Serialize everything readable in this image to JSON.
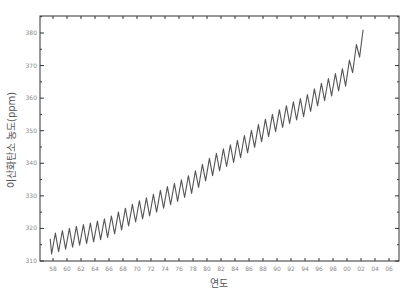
{
  "chart_data": {
    "type": "line",
    "title": "",
    "xlabel": "연도",
    "ylabel": "이산화탄소 농도(ppm)",
    "xlim": [
      1958,
      2006
    ],
    "ylim": [
      310,
      380
    ],
    "x_ticks": [
      "58",
      "60",
      "62",
      "64",
      "66",
      "68",
      "70",
      "72",
      "74",
      "76",
      "78",
      "80",
      "82",
      "84",
      "86",
      "88",
      "90",
      "92",
      "94",
      "96",
      "98",
      "00",
      "02",
      "04",
      "06"
    ],
    "y_ticks": [
      310,
      320,
      330,
      340,
      350,
      360,
      370,
      380
    ],
    "grid": false,
    "legend": null,
    "series": [
      {
        "name": "CO2 concentration (seasonal)",
        "color": "#555555",
        "seasonal_amplitude_ppm": 3,
        "trend_x": [
          1957.6,
          1960,
          1962,
          1964,
          1966,
          1968,
          1970,
          1972,
          1974,
          1976,
          1978,
          1980,
          1982,
          1984,
          1986,
          1988,
          1990,
          1992,
          1994,
          1996,
          1998,
          2000,
          2002.3
        ],
        "trend_y": [
          315.0,
          316.8,
          318.0,
          319.0,
          320.4,
          322.8,
          325.2,
          327.0,
          329.5,
          331.5,
          334.0,
          338.0,
          341.0,
          343.5,
          346.5,
          350.0,
          353.0,
          355.5,
          357.5,
          361.0,
          364.0,
          367.0,
          378.0
        ]
      }
    ]
  },
  "layout": {
    "plot_left": 40,
    "plot_right": 399,
    "plot_top": 16,
    "plot_bottom": 261,
    "x0_px": 53,
    "px_per_year": 7,
    "y310_px": 261,
    "y380_px": 33
  }
}
